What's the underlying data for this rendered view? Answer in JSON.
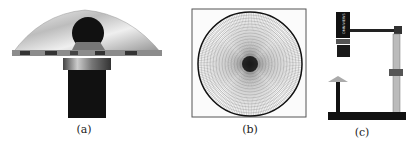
{
  "figure": {
    "subfigures": [
      {
        "id": "a",
        "caption": "(a)",
        "subject": "catadioptric mirror with camera"
      },
      {
        "id": "b",
        "caption": "(b)",
        "subject": "polar calibration pattern"
      },
      {
        "id": "c",
        "caption": "(c)",
        "subject": "camera rig on stand"
      }
    ],
    "camera_label": "OMNIVIEWS"
  },
  "colors": {
    "background": "#ffffff",
    "metal_light": "#e6e6e6",
    "metal_dark": "#555555",
    "black": "#111111"
  }
}
